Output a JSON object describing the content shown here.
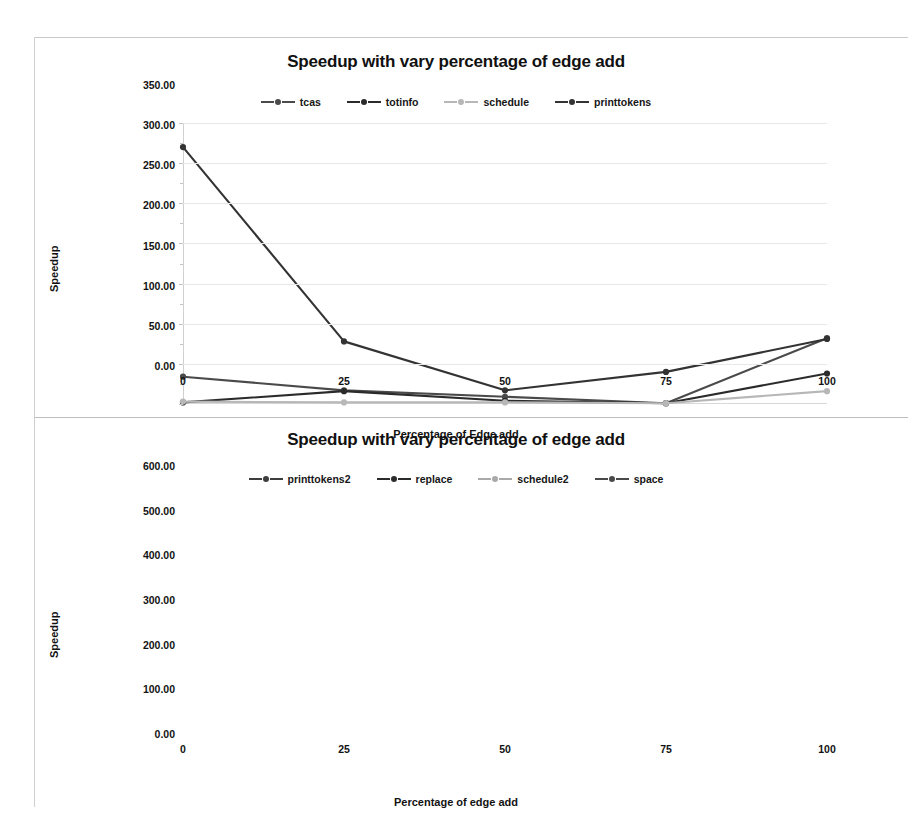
{
  "charts": [
    {
      "title": "Speedup with vary percentage of edge add",
      "xlabel": "Percentage of Edge add",
      "ylabel": "Speedup",
      "yticks": [
        "0.00",
        "50.00",
        "100.00",
        "150.00",
        "200.00",
        "250.00",
        "300.00",
        "350.00"
      ],
      "xticks": [
        "0",
        "25",
        "50",
        "75",
        "100"
      ],
      "legend": [
        "tcas",
        "totinfo",
        "schedule",
        "printtokens"
      ]
    },
    {
      "title": "Speedup with vary percentage of edge add",
      "xlabel": "Percentage of edge add",
      "ylabel": "Speedup",
      "yticks": [
        "0.00",
        "100.00",
        "200.00",
        "300.00",
        "400.00",
        "500.00",
        "600.00"
      ],
      "xticks": [
        "0",
        "25",
        "50",
        "75",
        "100"
      ],
      "legend": [
        "printtokens2",
        "replace",
        "schedule2",
        "space"
      ]
    }
  ],
  "chart_data": [
    {
      "type": "line",
      "title": "Speedup with vary percentage of edge add",
      "xlabel": "Percentage of Edge add",
      "ylabel": "Speedup",
      "categories": [
        0,
        25,
        50,
        75,
        100
      ],
      "xlim": [
        0,
        100
      ],
      "ylim": [
        0,
        350
      ],
      "ytick_step": 50,
      "grid": true,
      "legend_position": "top-center",
      "series": [
        {
          "name": "tcas",
          "color": "#4a4a4a",
          "values": [
            34,
            17,
            9,
            1,
            82
          ]
        },
        {
          "name": "totinfo",
          "color": "#2b2b2b",
          "values": [
            2,
            16,
            4,
            1,
            38
          ]
        },
        {
          "name": "schedule",
          "color": "#b7b7b7",
          "values": [
            3,
            2,
            2,
            1,
            16
          ]
        },
        {
          "name": "printtokens",
          "color": "#333333",
          "values": [
            320,
            78,
            17,
            40,
            81
          ]
        }
      ]
    },
    {
      "type": "line",
      "title": "Speedup with vary percentage of edge add",
      "xlabel": "Percentage of edge add",
      "ylabel": "Speedup",
      "categories": [
        0,
        25,
        50,
        75,
        100
      ],
      "xlim": [
        0,
        100
      ],
      "ylim": [
        0,
        600
      ],
      "ytick_step": 100,
      "grid": true,
      "legend_position": "top-center",
      "series": [
        {
          "name": "printtokens2",
          "color": "#3d3d3d",
          "values": [
            160,
            113,
            121,
            105,
            412
          ]
        },
        {
          "name": "replace",
          "color": "#2b2b2b",
          "values": [
            5,
            36,
            30,
            45,
            40
          ]
        },
        {
          "name": "schedule2",
          "color": "#a9a9a9",
          "values": [
            16,
            2,
            3,
            8,
            485
          ]
        },
        {
          "name": "space",
          "color": "#4a4a4a",
          "values": [
            3,
            5,
            6,
            10,
            38
          ]
        }
      ]
    }
  ]
}
